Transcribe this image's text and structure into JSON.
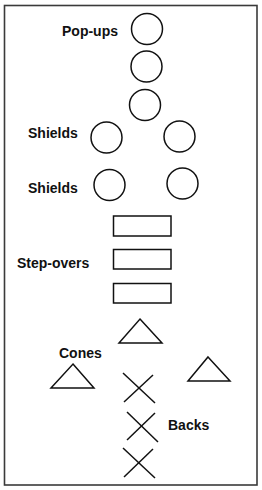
{
  "diagram": {
    "colors": {
      "background": "#ffffff",
      "stroke": "#111111",
      "frame": "#3a3a3a"
    },
    "groups": {
      "popups": {
        "label": "Pop-ups",
        "shape": "circle",
        "count": 3
      },
      "shields_row1": {
        "label": "Shields",
        "shape": "circle",
        "count": 2
      },
      "shields_row2": {
        "label": "Shields",
        "shape": "circle",
        "count": 2
      },
      "stepovers": {
        "label": "Step-overs",
        "shape": "rectangle",
        "count": 3
      },
      "cones": {
        "label": "Cones",
        "shape": "triangle",
        "count": 3
      },
      "backs": {
        "label": "Backs",
        "shape": "x-mark",
        "count": 3
      }
    }
  }
}
